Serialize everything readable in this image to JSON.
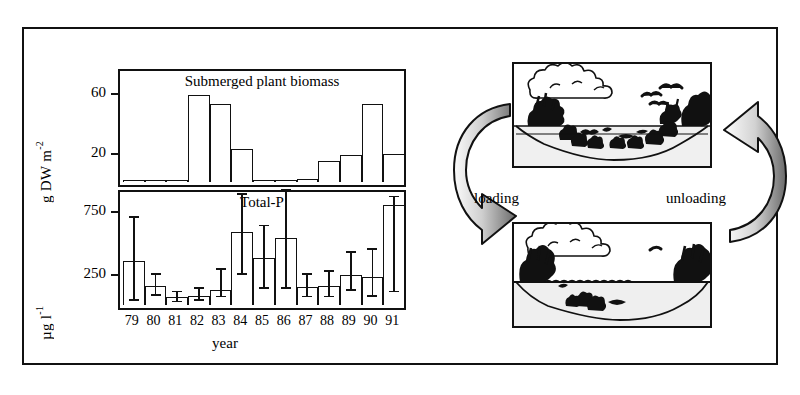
{
  "figure": {
    "xaxis_label": "year",
    "arrows": {
      "loading_label": "loading",
      "unloading_label": "unloading"
    },
    "illustrations": {
      "top": {
        "name": "clear-water-vegetated-lake",
        "caption": ""
      },
      "bottom": {
        "name": "turbid-water-lake",
        "caption": ""
      }
    },
    "colors": {
      "ink": "#111111",
      "background": "#ffffff",
      "arrow_light": "#f2f2f2",
      "arrow_dark": "#6e6e6e"
    }
  },
  "chart_data": [
    {
      "type": "bar",
      "id": "submerged-plant-biomass",
      "title": "Submerged plant biomass",
      "xlabel": "year",
      "ylabel": "g DW m-2",
      "ylabel_display": "g DW m",
      "ylabel_exponent": "-2",
      "categories": [
        "79",
        "80",
        "81",
        "82",
        "83",
        "84",
        "85",
        "86",
        "87",
        "88",
        "89",
        "90",
        "91"
      ],
      "values": [
        0,
        0,
        0,
        58,
        52,
        22,
        0.5,
        0.5,
        2,
        14,
        18,
        52,
        19
      ],
      "ytick_values": [
        20,
        60
      ],
      "ytick_labels": [
        "20",
        "60"
      ],
      "ylim": [
        0,
        75
      ],
      "grid": false,
      "legend": "none"
    },
    {
      "type": "bar",
      "id": "total-p",
      "title": "Total-P",
      "xlabel": "year",
      "ylabel": "ug l-1",
      "ylabel_display": "µg l",
      "ylabel_exponent": "-1",
      "categories": [
        "79",
        "80",
        "81",
        "82",
        "83",
        "84",
        "85",
        "86",
        "87",
        "88",
        "89",
        "90",
        "91"
      ],
      "values": [
        350,
        150,
        60,
        75,
        120,
        580,
        370,
        530,
        140,
        150,
        240,
        225,
        790
      ],
      "errors_low": [
        320,
        80,
        40,
        45,
        60,
        340,
        240,
        400,
        80,
        90,
        130,
        160,
        690
      ],
      "errors_high": [
        340,
        90,
        40,
        50,
        160,
        290,
        250,
        390,
        100,
        110,
        170,
        210,
        60
      ],
      "ytick_values": [
        250,
        750
      ],
      "ytick_labels": [
        "250",
        "750"
      ],
      "ylim": [
        0,
        900
      ],
      "grid": false,
      "legend": "none"
    }
  ]
}
